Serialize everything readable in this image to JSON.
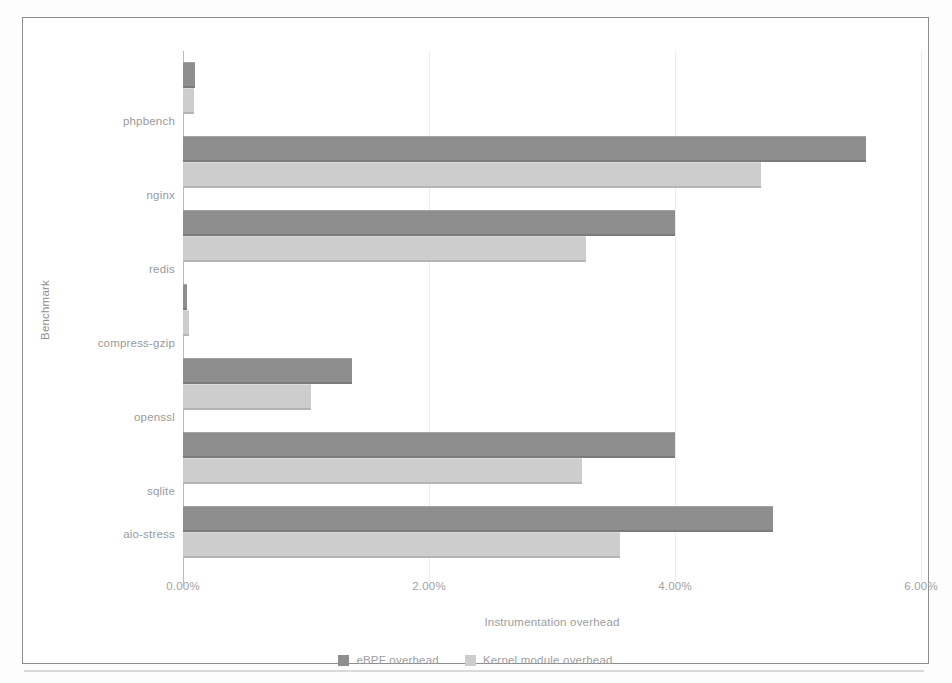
{
  "chart_data": {
    "type": "bar",
    "orientation": "horizontal",
    "title": "",
    "xlabel": "Instrumentation overhead",
    "ylabel": "Benchmark",
    "categories": [
      "phpbench",
      "nginx",
      "redis",
      "compress-gzip",
      "openssl",
      "sqlite",
      "aio-stress"
    ],
    "series": [
      {
        "name": "eBPF overhead",
        "color": "#8e8e8e",
        "values": [
          0.1,
          5.55,
          4.0,
          0.03,
          1.37,
          4.0,
          4.8
        ]
      },
      {
        "name": "Kernel module overhead",
        "color": "#cdcdcd",
        "values": [
          0.09,
          4.7,
          3.28,
          0.05,
          1.04,
          3.24,
          3.55
        ]
      }
    ],
    "xlim": [
      0,
      6
    ],
    "xticks": [
      0,
      2,
      4,
      6
    ],
    "xtick_labels": [
      "0.00%",
      "2.00%",
      "4.00%",
      "6.00%"
    ],
    "xtick_format": "percent",
    "grid": true,
    "grid_axis": "x",
    "grid_color": "#ececec",
    "legend_position": "bottom",
    "legend_entries": [
      "eBPF overhead",
      "Kernel module overhead"
    ],
    "annotations": []
  },
  "figure": {
    "background_color": "#ffffff",
    "border_color": "#8d8d8d",
    "axis_color": "#b9b9b9",
    "label_color": "#9a9a9a"
  }
}
